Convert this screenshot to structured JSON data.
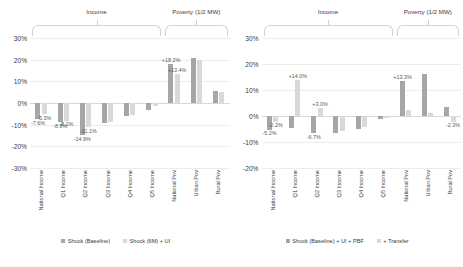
{
  "chart_data": [
    {
      "type": "bar",
      "panel": "left",
      "title": "",
      "xlabel": "",
      "ylabel": "",
      "ylim": [
        -30,
        30
      ],
      "yticks": [
        "30%",
        "20%",
        "10%",
        "0%",
        "-10%",
        "-20%",
        "-30%"
      ],
      "ytick_values": [
        30,
        20,
        10,
        0,
        -10,
        -20,
        -30
      ],
      "grid": true,
      "legend_position": "bottom",
      "groups": [
        {
          "label": "Income",
          "start": 0,
          "end": 5
        },
        {
          "label": "Poverty (1/2 MW)",
          "start": 6,
          "end": 8
        }
      ],
      "categories": [
        "National Income",
        "Q1 Income",
        "Q2 Income",
        "Q3 Income",
        "Q4 Income",
        "Q5 Income",
        "National Pov",
        "Urban Pov",
        "Rural Pov"
      ],
      "series": [
        {
          "name": "Shock (Baseline)",
          "color": "#a6a6a6",
          "values": [
            -7.6,
            -8.8,
            -14.9,
            -9.2,
            -5.8,
            -3.1,
            18.2,
            21.0,
            5.6
          ],
          "labels": [
            "-7.6%",
            "-8.8%",
            "-14.9%",
            "",
            "",
            "",
            "+18.2%",
            "",
            ""
          ]
        },
        {
          "name": "Shock (6M) + UI",
          "color": "#d9d9d9",
          "values": [
            -5.3,
            -8.2,
            -11.1,
            -8.6,
            -5.4,
            -1.6,
            13.4,
            19.8,
            5.0
          ],
          "labels": [
            "-5.3%",
            "-8.2%",
            "-11.1%",
            "",
            "",
            "",
            "+13.4%",
            "",
            ""
          ]
        }
      ]
    },
    {
      "type": "bar",
      "panel": "right",
      "title": "",
      "xlabel": "",
      "ylabel": "",
      "ylim": [
        -20,
        30
      ],
      "yticks": [
        "30%",
        "20%",
        "10%",
        "0%",
        "-10%",
        "-20%"
      ],
      "ytick_values": [
        30,
        20,
        10,
        0,
        -10,
        -20
      ],
      "grid": true,
      "legend_position": "bottom",
      "groups": [
        {
          "label": "Income",
          "start": 0,
          "end": 5
        },
        {
          "label": "Poverty (1/2 MW)",
          "start": 6,
          "end": 8
        }
      ],
      "categories": [
        "National Income",
        "Q1 Income",
        "Q2 Income",
        "Q3 Income",
        "Q4 Income",
        "Q5 Income",
        "National Pov",
        "Urban Pov",
        "Rural Pov"
      ],
      "series": [
        {
          "name": "Shock (Baseline) + UI + PBF",
          "color": "#a6a6a6",
          "values": [
            -5.2,
            -4.6,
            -6.7,
            -6.4,
            -5.1,
            -1.3,
            13.3,
            16.0,
            3.4
          ],
          "labels": [
            "-5.2%",
            "",
            "-6.7%",
            "",
            "",
            "",
            "+13.3%",
            "",
            ""
          ]
        },
        {
          "name": "+ Transfer",
          "color": "#d9d9d9",
          "values": [
            -2.2,
            14.0,
            3.0,
            -5.6,
            -4.4,
            -0.8,
            2.2,
            1.0,
            -2.3
          ],
          "labels": [
            "-2.2%",
            "+14.0%",
            "+3.0%",
            "",
            "",
            "",
            "",
            "",
            "-2.3%"
          ]
        }
      ]
    }
  ]
}
